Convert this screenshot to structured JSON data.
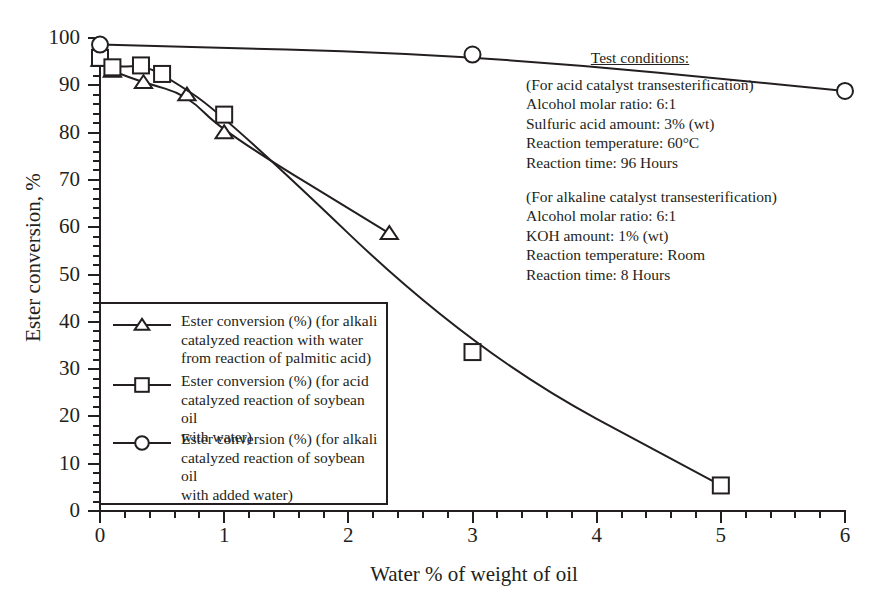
{
  "chart_data": {
    "type": "line",
    "title": "",
    "xlabel": "Water % of weight of oil",
    "ylabel": "Ester conversion, %",
    "xlim": [
      0,
      6
    ],
    "ylim": [
      0,
      100
    ],
    "xticks": [
      "0",
      "1",
      "2",
      "3",
      "4",
      "5",
      "6"
    ],
    "yticks": [
      "0",
      "10",
      "20",
      "30",
      "40",
      "50",
      "60",
      "70",
      "80",
      "90",
      "100"
    ],
    "x_major_step": 1,
    "x_minor_step": 0.2,
    "y_major_step": 10,
    "y_minor_step": 2,
    "grid": false,
    "legend_position": "lower-left-inside",
    "series": [
      {
        "name": "Ester conversion (%) (for alkali catalyzed reaction with water from reaction of palmitic acid)",
        "marker": "triangle",
        "points": [
          {
            "x": 0.0,
            "y": 95.3
          },
          {
            "x": 0.1,
            "y": 93.0
          },
          {
            "x": 0.35,
            "y": 90.6
          },
          {
            "x": 0.7,
            "y": 88.0
          },
          {
            "x": 1.0,
            "y": 80.0
          },
          {
            "x": 2.33,
            "y": 58.7
          }
        ]
      },
      {
        "name": "Ester conversion (%) (for acid catalyzed reaction of soybean oil with water)",
        "marker": "square",
        "points": [
          {
            "x": 0.0,
            "y": 95.8
          },
          {
            "x": 0.1,
            "y": 93.8
          },
          {
            "x": 0.33,
            "y": 94.2
          },
          {
            "x": 0.5,
            "y": 92.4
          },
          {
            "x": 1.0,
            "y": 83.8
          },
          {
            "x": 3.0,
            "y": 33.6
          },
          {
            "x": 5.0,
            "y": 5.4
          }
        ]
      },
      {
        "name": "Ester conversion (%) (for alkali catalyzed reaction of soybean oil with added water)",
        "marker": "circle",
        "points": [
          {
            "x": 0.0,
            "y": 98.6
          },
          {
            "x": 3.0,
            "y": 96.5
          },
          {
            "x": 6.0,
            "y": 88.8
          }
        ]
      }
    ]
  },
  "axes": {
    "y_title": "Ester conversion, %",
    "x_title": "Water % of weight of oil",
    "y_tick_labels": [
      "100",
      "90",
      "80",
      "70",
      "60",
      "50",
      "40",
      "30",
      "20",
      "10",
      "0"
    ],
    "x_tick_labels": [
      "0",
      "1",
      "2",
      "3",
      "4",
      "5",
      "6"
    ]
  },
  "legend": {
    "entries": [
      {
        "marker": "triangle",
        "lines": [
          "Ester conversion (%) (for alkali",
          "catalyzed reaction with water",
          "from reaction of palmitic acid)"
        ]
      },
      {
        "marker": "square",
        "lines": [
          "Ester conversion (%) (for acid",
          "catalyzed reaction of soybean oil",
          "with water)"
        ]
      },
      {
        "marker": "circle",
        "lines": [
          "Ester conversion (%) (for alkali",
          "catalyzed reaction of soybean oil",
          "with added water)"
        ]
      }
    ]
  },
  "conditions": {
    "title": "Test conditions:",
    "acid_block": [
      "(For acid catalyst transesterification)",
      "Alcohol molar ratio: 6:1",
      "Sulfuric acid amount: 3% (wt)",
      "Reaction temperature: 60°C",
      "Reaction time: 96 Hours"
    ],
    "alkaline_block": [
      "(For alkaline catalyst transesterification)",
      "Alcohol molar ratio: 6:1",
      "KOH amount: 1% (wt)",
      "Reaction temperature: Room",
      "Reaction time: 8 Hours"
    ]
  },
  "colors": {
    "ink": "#231f20",
    "background": "#ffffff"
  }
}
